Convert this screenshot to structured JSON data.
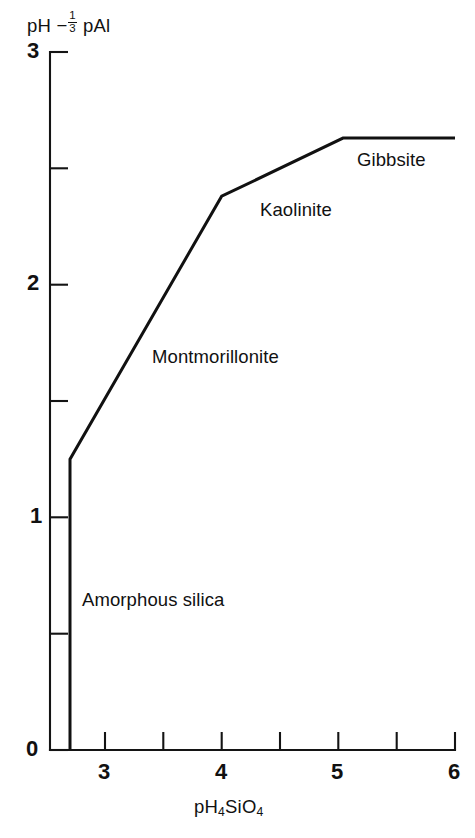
{
  "chart_data": {
    "type": "line",
    "title": "",
    "xlabel": "pH4SiO4",
    "ylabel": "pH - 1/3 pAl",
    "xlim": [
      2.55,
      6.0
    ],
    "ylim": [
      0.0,
      3.0
    ],
    "grid": false,
    "legend_position": "none",
    "x_ticks_major": [
      3,
      4,
      5,
      6
    ],
    "x_tick_labels": [
      "3",
      "4",
      "5",
      "6"
    ],
    "x_ticks_minor": [
      3.5,
      4.5,
      5.5
    ],
    "y_ticks_major": [
      0,
      1,
      2,
      3
    ],
    "y_tick_labels": [
      "0",
      "1",
      "2",
      "3"
    ],
    "y_ticks_minor": [
      0.5,
      1.5,
      2.5
    ],
    "series": [
      {
        "name": "mineral stability boundary",
        "x": [
          2.7,
          2.7,
          4.0,
          5.04,
          6.0
        ],
        "y": [
          0.0,
          1.25,
          2.38,
          2.63,
          2.63
        ]
      }
    ],
    "annotations": [
      {
        "id": "gibbsite",
        "text": "Gibbsite",
        "x": 5.18,
        "y": 2.54
      },
      {
        "id": "kaolinite",
        "text": "Kaolinite",
        "x": 4.35,
        "y": 2.33
      },
      {
        "id": "montmorillonite",
        "text": "Montmorillonite",
        "x": 3.4,
        "y": 1.67
      },
      {
        "id": "amorphous-silica",
        "text": "Amorphous silica",
        "x": 2.8,
        "y": 0.64
      }
    ]
  },
  "axis_titles": {
    "y_prefix": "pH",
    "y_minus": "−",
    "y_frac_num": "1",
    "y_frac_den": "3",
    "y_suffix": "pAl",
    "x_part1": "pH",
    "x_sub1": "4",
    "x_part2": "SiO",
    "x_sub2": "4"
  },
  "tick_labels": {
    "y": [
      "3",
      "2",
      "1",
      "0"
    ],
    "x": [
      "3",
      "4",
      "5",
      "6"
    ]
  },
  "region_labels": {
    "gibbsite": "Gibbsite",
    "kaolinite": "Kaolinite",
    "montmorillonite": "Montmorillonite",
    "amorphous_silica": "Amorphous silica"
  },
  "colors": {
    "ink": "#111111",
    "background": "#ffffff"
  }
}
